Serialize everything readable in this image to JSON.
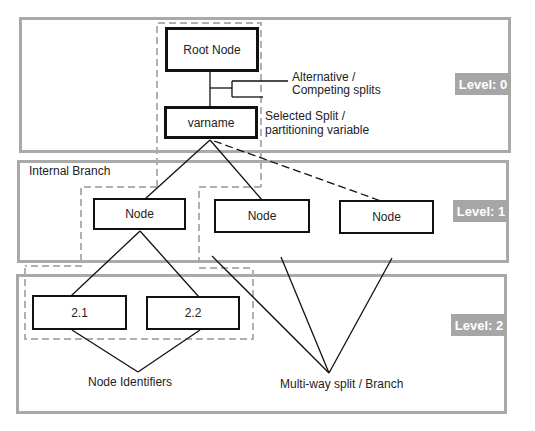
{
  "diagram": {
    "levels": [
      {
        "id": "level-0",
        "label": "Level: 0"
      },
      {
        "id": "level-1",
        "label": "Level: 1"
      },
      {
        "id": "level-2",
        "label": "Level: 2"
      }
    ],
    "nodes": {
      "root": "Root Node",
      "varname": "varname",
      "level1": [
        "Node",
        "Node",
        "Node"
      ],
      "level2": [
        "2.1",
        "2.2"
      ]
    },
    "annotations": {
      "alternative_line1": "Alternative /",
      "alternative_line2": "Competing splits",
      "selected_line1": "Selected Split /",
      "selected_line2": "partitioning variable",
      "internal_branch": "Internal Branch",
      "node_identifiers": "Node Identifiers",
      "multiway": "Multi-way split / Branch"
    },
    "colors": {
      "band_border": "#a9a9a9",
      "badge_bg": "#a6a6a6",
      "badge_text": "#ffffff",
      "node_border": "#111111",
      "dashed_group": "#b0b0b0"
    }
  }
}
